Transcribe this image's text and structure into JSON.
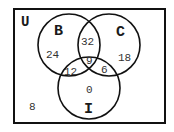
{
  "diagram": {
    "type": "venn-3",
    "universe": {
      "label": "U",
      "outside_count": "8"
    },
    "sets": {
      "B": {
        "label": "B"
      },
      "C": {
        "label": "C"
      },
      "I": {
        "label": "I"
      }
    },
    "regions": {
      "B_only": "24",
      "C_only": "18",
      "I_only": "0",
      "B_and_C_only": "32",
      "B_and_I_only": "12",
      "C_and_I_only": "6",
      "B_and_C_and_I": "9"
    },
    "colors": {
      "stroke": "#111111",
      "background": "#ffffff",
      "text": "#333333"
    }
  }
}
